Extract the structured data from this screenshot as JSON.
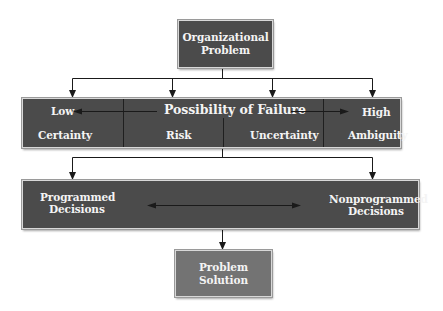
{
  "colors": {
    "dark_box": "#4b4b4b",
    "light_box": "#737373",
    "text": "#f4f4f4",
    "line": "#1a1a1a"
  },
  "top_box": {
    "line1": "Organizational",
    "line2": "Problem"
  },
  "band1": {
    "axis_label": "Possibility of Failure",
    "low_label": "Low",
    "high_label": "High",
    "categories": [
      "Certainty",
      "Risk",
      "Uncertainty",
      "Ambiguity"
    ]
  },
  "band2": {
    "left": {
      "line1": "Programmed",
      "line2": "Decisions"
    },
    "right": {
      "line1": "Nonprogrammed",
      "line2": "Decisions"
    }
  },
  "bottom_box": {
    "line1": "Problem",
    "line2": "Solution"
  }
}
